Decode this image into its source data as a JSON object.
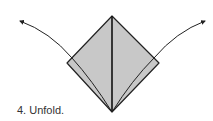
{
  "step": {
    "number": "4",
    "caption": "4. Unfold."
  },
  "colors": {
    "paper_fill": "#c8c8c8",
    "stroke": "#222222",
    "text": "#333333"
  },
  "icons": {
    "left_arrow": "curved-arrow-up-left",
    "right_arrow": "curved-arrow-up-right"
  }
}
